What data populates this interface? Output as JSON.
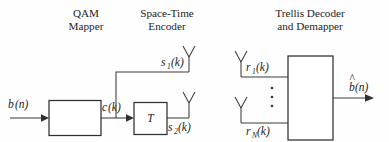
{
  "figure": {
    "kind": "block-diagram",
    "background_color": "#fefefe",
    "line_color": "#3b3b3b",
    "text_color": "#1d1d1d"
  },
  "headings": {
    "qam_mapper_line1": "QAM",
    "qam_mapper_line2": "Mapper",
    "space_time_line1": "Space-Time",
    "space_time_line2": "Encoder",
    "decoder_line1": "Trellis Decoder",
    "decoder_line2": "and Demapper"
  },
  "signals": {
    "input": {
      "base": "b",
      "sub": "",
      "arg": "(n)"
    },
    "mapper_output": {
      "base": "c",
      "sub": "",
      "arg": "(k)"
    },
    "tx_stream_1": {
      "base": "s",
      "sub": "1",
      "arg": "(k)"
    },
    "tx_stream_2": {
      "base": "s",
      "sub": "2",
      "arg": "(k)"
    },
    "rx_stream_1": {
      "base": "r",
      "sub": "1",
      "arg": "(k)"
    },
    "rx_stream_n": {
      "base": "r",
      "sub": "N",
      "arg": "(k)"
    },
    "output": {
      "base": "b",
      "sub": "",
      "arg": "(n)",
      "accent": "^"
    }
  },
  "blocks": {
    "qam_mapper_label": "",
    "delay_label": "T",
    "decoder_label": ""
  },
  "ellipsis": {
    "receiver_vertical_dots": "⋮",
    "dot_count": 3
  },
  "antennas": {
    "transmit_count": 2,
    "receive_count": 2,
    "shape": "dipole-y"
  }
}
